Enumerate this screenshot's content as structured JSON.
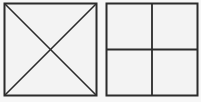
{
  "diagram": {
    "figures": [
      {
        "name": "square-with-diagonals",
        "divisions": "diagonals",
        "regions": 4
      },
      {
        "name": "square-with-quadrants",
        "divisions": "midlines",
        "regions": 4
      }
    ],
    "colors": {
      "stroke": "#2b2b2b",
      "fill": "#f3f3f3",
      "background": "#f7f7f7"
    }
  }
}
